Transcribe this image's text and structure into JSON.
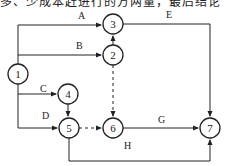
{
  "top_text": "多、少成本赶进行的方两量，最后结论",
  "nodes": [
    {
      "id": "1",
      "label": "1",
      "x": 18,
      "y": 74
    },
    {
      "id": "2",
      "label": "2",
      "x": 113,
      "y": 55
    },
    {
      "id": "3",
      "label": "3",
      "x": 113,
      "y": 24
    },
    {
      "id": "4",
      "label": "4",
      "x": 68,
      "y": 94
    },
    {
      "id": "5",
      "label": "5",
      "x": 69,
      "y": 128
    },
    {
      "id": "6",
      "label": "6",
      "x": 113,
      "y": 128
    },
    {
      "id": "7",
      "label": "7",
      "x": 210,
      "y": 128
    }
  ],
  "activities": [
    {
      "label": "A",
      "from": "1",
      "to": "3",
      "dummy": false
    },
    {
      "label": "B",
      "from": "1",
      "to": "2",
      "dummy": false
    },
    {
      "label": "C",
      "from": "1",
      "to": "4",
      "dummy": false
    },
    {
      "label": "D",
      "from": "1",
      "to": "5",
      "dummy": false
    },
    {
      "label": "E",
      "from": "3",
      "to": "7",
      "dummy": false
    },
    {
      "label": "G",
      "from": "6",
      "to": "7",
      "dummy": false
    },
    {
      "label": "H",
      "from": "5",
      "to": "7",
      "dummy": false
    },
    {
      "label": "",
      "from": "2",
      "to": "3",
      "dummy": false
    },
    {
      "label": "",
      "from": "4",
      "to": "5",
      "dummy": false
    },
    {
      "label": "",
      "from": "2",
      "to": "6",
      "dummy": true
    },
    {
      "label": "",
      "from": "5",
      "to": "6",
      "dummy": true
    }
  ],
  "labels": {
    "A": "A",
    "B": "B",
    "C": "C",
    "D": "D",
    "E": "E",
    "G": "G",
    "H": "H"
  }
}
